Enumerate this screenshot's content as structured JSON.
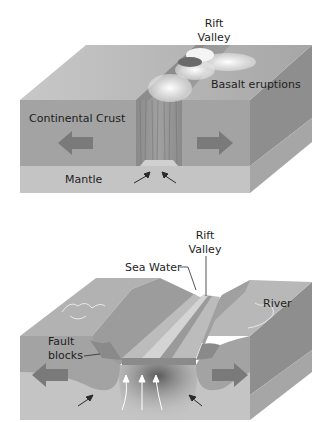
{
  "diagrams": [
    {
      "id": "continental-rift",
      "labels": {
        "rift_valley_line1": "Rift",
        "rift_valley_line2": "Valley",
        "basalt": "Basalt eruptions",
        "crust": "Continental Crust",
        "mantle": "Mantle"
      },
      "arrows": [
        "left-spreading",
        "right-spreading",
        "mantle-upwelling-left",
        "mantle-upwelling-right"
      ]
    },
    {
      "id": "oceanic-rift",
      "labels": {
        "rift_valley_line1": "Rift",
        "rift_valley_line2": "Valley",
        "sea_water": "Sea Water",
        "river": "River",
        "fault_line1": "Fault",
        "fault_line2": "blocks"
      },
      "arrows": [
        "left-spreading",
        "right-spreading",
        "upwelling-1",
        "upwelling-2",
        "upwelling-3",
        "mantle-left",
        "mantle-right"
      ]
    }
  ],
  "colors": {
    "top_face": "#b4b4b4",
    "crust_front": "#a3a3a3",
    "mantle_front": "#c4c4c4",
    "side_crust": "#8e8e8e",
    "side_mantle": "#a8a8a8",
    "arrow": "#7a7a7a",
    "text": "#1e1e1e"
  }
}
